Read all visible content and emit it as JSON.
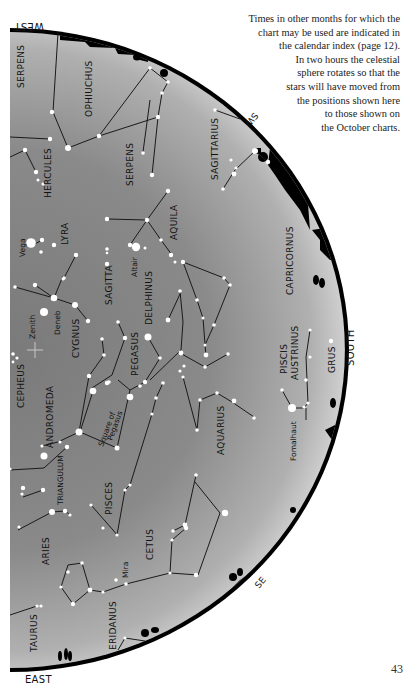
{
  "caption": {
    "lines": [
      "Times in other months for which the",
      "chart may be used are indicated in",
      "the calendar index (page 12).",
      "In two hours the celestial",
      "sphere rotates so that the",
      "stars will have moved from",
      "the positions shown here",
      "to those shown on",
      "the October charts."
    ]
  },
  "page_number": "43",
  "directions": {
    "west": "WEST",
    "east": "EAST",
    "south": "SOUTH",
    "sw": "SW",
    "se": "SE"
  },
  "map": {
    "sky_colors": {
      "zenith": "#7a7a7a",
      "horizon": "#c8c8c8",
      "horizon_band": "#000000"
    },
    "zenith_label": "Zenith",
    "constellations": {
      "serpens_caput": "SERPENS",
      "ophiuchus": "OPHIUCHUS",
      "hercules": "HERCULES",
      "serpens_cauda": "SERPENS",
      "sagittarius": "SAGITTARIUS",
      "lyra": "LYRA",
      "aquila": "AQUILA",
      "sagitta": "SAGITTA",
      "delphinus": "DELPHINUS",
      "capricornus": "CAPRICORNUS",
      "cygnus": "CYGNUS",
      "pegasus": "PEGASUS",
      "cepheus": "CEPHEUS",
      "andromeda": "ANDROMEDA",
      "piscis_austrinus_1": "PISCIS",
      "piscis_austrinus_2": "AUSTRINUS",
      "grus": "GRUS",
      "aquarius": "AQUARIUS",
      "triangulum": "TRIANGULUM",
      "aries": "ARIES",
      "pisces": "PISCES",
      "cetus": "CETUS",
      "eridanus": "ERIDANUS",
      "taurus": "TAURUS"
    },
    "asterisms": {
      "square_line1": "Square of",
      "square_line2": "Pegasus"
    },
    "stars": {
      "vega": "Vega",
      "altair": "Altair",
      "deneb": "Deneb",
      "fomalhaut": "Fomalhaut",
      "mira": "Mira"
    }
  }
}
